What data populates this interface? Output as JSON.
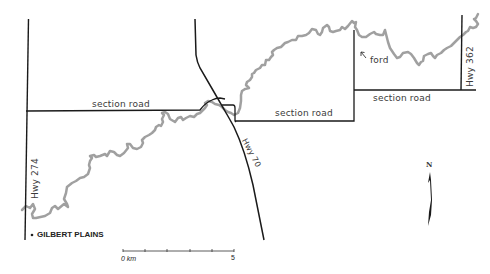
{
  "map": {
    "title": "",
    "colors": {
      "road": "#1a1a1a",
      "river": "#a0a0a0",
      "background": "#ffffff"
    },
    "labels": {
      "section_road_west": "section road",
      "section_road_center": "section road",
      "section_road_east": "section road",
      "hwy_274": "Hwy 274",
      "hwy_70": "Hwy 70",
      "hwy_362": "Hwy 362",
      "ford": "ford",
      "town": "GILBERT PLAINS"
    },
    "scale_bar": {
      "start_label": "0 km",
      "end_label": "5",
      "divisions": 5
    },
    "north_arrow": {
      "label": "N"
    }
  }
}
